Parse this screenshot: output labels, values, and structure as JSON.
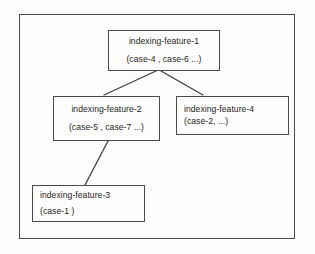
{
  "diagram": {
    "background_color": "#fcfcfb",
    "line_color": "#4a4a4a",
    "text_color": "#1d1d1d",
    "nodes": [
      {
        "id": "indexing-feature-1",
        "label": "indexing-feature-1",
        "cases": "(case-4 , case-6 ...)",
        "align": "center"
      },
      {
        "id": "indexing-feature-2",
        "label": "indexing-feature-2",
        "cases": "(case-5 , case-7 ...)",
        "align": "center"
      },
      {
        "id": "indexing-feature-4",
        "label": "indexing-feature-4",
        "cases": "(case-2, ...)",
        "align": "left"
      },
      {
        "id": "indexing-feature-3",
        "label": "indexing-feature-3",
        "cases": "(case-1 )",
        "align": "left"
      }
    ],
    "edges": [
      {
        "from": "indexing-feature-1",
        "to": "indexing-feature-2"
      },
      {
        "from": "indexing-feature-1",
        "to": "indexing-feature-4"
      },
      {
        "from": "indexing-feature-2",
        "to": "indexing-feature-3"
      }
    ]
  }
}
